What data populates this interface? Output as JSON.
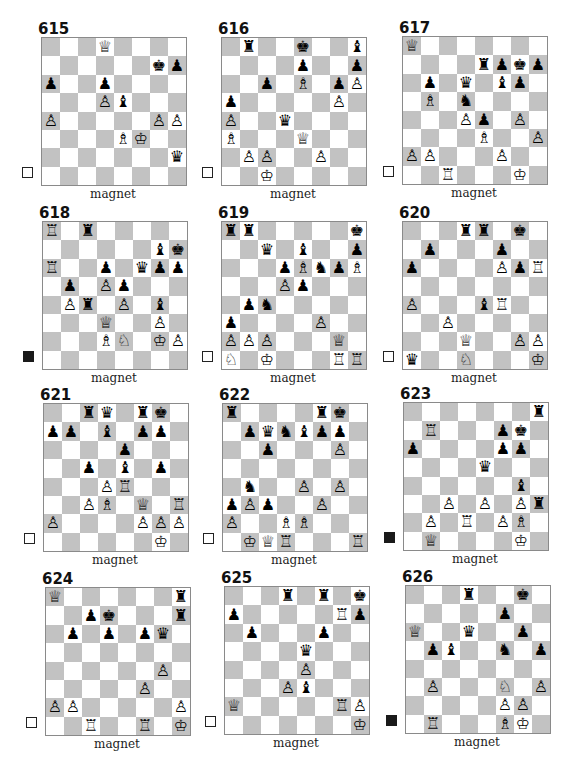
{
  "page": {
    "diagrams": [
      {
        "number": "615",
        "to_move": "white",
        "caption": "magnet",
        "pieces": {
          "d8": "wQ",
          "g7": "bK",
          "h7": "bP",
          "a6": "bP",
          "d6": "bP",
          "d5": "wP",
          "e5": "bB",
          "a4": "wP",
          "g4": "wP",
          "h4": "wP",
          "e3": "wB",
          "f3": "wK",
          "h2": "bQ"
        }
      },
      {
        "number": "616",
        "to_move": "white",
        "caption": "magnet",
        "pieces": {
          "b8": "bR",
          "e8": "bK",
          "h8": "bB",
          "e7": "bP",
          "h7": "bP",
          "c6": "bP",
          "e6": "wB",
          "g6": "bP",
          "h6": "wP",
          "a5": "bP",
          "g5": "wP",
          "a4": "wP",
          "d4": "bQ",
          "a3": "wB",
          "e3": "wQ",
          "b2": "wP",
          "c2": "wP",
          "f2": "wP",
          "c1": "wK"
        }
      },
      {
        "number": "617",
        "to_move": "white",
        "caption": "magnet",
        "pieces": {
          "a8": "wQ",
          "e7": "bR",
          "f7": "bP",
          "g7": "bK",
          "h7": "bP",
          "b6": "bP",
          "d6": "bQ",
          "f6": "bB",
          "g6": "bP",
          "b5": "wB",
          "d5": "bN",
          "d4": "wP",
          "e4": "bP",
          "g4": "wP",
          "e3": "wB",
          "h3": "wP",
          "a2": "wP",
          "b2": "wP",
          "f2": "wP",
          "c1": "wR",
          "g1": "wK"
        }
      },
      {
        "number": "618",
        "to_move": "black",
        "caption": "magnet",
        "pieces": {
          "a8": "wR",
          "c8": "bR",
          "g7": "bB",
          "h7": "bK",
          "a6": "wR",
          "d6": "bP",
          "f6": "bQ",
          "g6": "bP",
          "h6": "bP",
          "b5": "bP",
          "d5": "wP",
          "e5": "bP",
          "b4": "wP",
          "c4": "bR",
          "e4": "wP",
          "g4": "bB",
          "d3": "wQ",
          "g3": "wP",
          "d2": "wB",
          "e2": "wN",
          "g2": "wK",
          "h2": "wP"
        }
      },
      {
        "number": "619",
        "to_move": "white",
        "caption": "magnet",
        "pieces": {
          "a8": "bR",
          "b8": "bR",
          "h8": "bK",
          "c7": "bQ",
          "e7": "bB",
          "h7": "bP",
          "d6": "bP",
          "e6": "wB",
          "f6": "bN",
          "g6": "bP",
          "h6": "wB",
          "d5": "wP",
          "e5": "bP",
          "b4": "bP",
          "c4": "bN",
          "a3": "bP",
          "f3": "wP",
          "a2": "wP",
          "b2": "wP",
          "c2": "wP",
          "g2": "wQ",
          "a1": "wN",
          "c1": "wK",
          "g1": "wR",
          "h1": "wR"
        }
      },
      {
        "number": "620",
        "to_move": "white",
        "caption": "magnet",
        "pieces": {
          "d8": "bR",
          "e8": "bR",
          "g8": "bK",
          "b7": "bP",
          "f7": "bP",
          "a6": "bP",
          "f6": "wP",
          "g6": "bP",
          "h6": "wR",
          "a4": "wP",
          "e4": "bB",
          "f4": "wR",
          "c3": "wP",
          "d2": "wQ",
          "g2": "wP",
          "h2": "wP",
          "a1": "bQ",
          "d1": "wN",
          "h1": "wK"
        }
      },
      {
        "number": "621",
        "to_move": "white",
        "caption": "magnet",
        "pieces": {
          "c8": "bR",
          "d8": "bQ",
          "f8": "bR",
          "g8": "bK",
          "a7": "bP",
          "b7": "bP",
          "d7": "bB",
          "f7": "bP",
          "g7": "bP",
          "e6": "bP",
          "c5": "bP",
          "e5": "bB",
          "g5": "bP",
          "d4": "wP",
          "e4": "wR",
          "c3": "wP",
          "d3": "wB",
          "f3": "wQ",
          "h3": "wR",
          "a2": "wP",
          "f2": "wP",
          "g2": "wP",
          "h2": "wP",
          "g1": "wK"
        }
      },
      {
        "number": "622",
        "to_move": "white",
        "caption": "magnet",
        "pieces": {
          "a8": "bR",
          "f8": "bR",
          "g8": "bK",
          "b7": "bP",
          "c7": "bQ",
          "d7": "bN",
          "e7": "bB",
          "f7": "bP",
          "g7": "bP",
          "c6": "bP",
          "g6": "wP",
          "b4": "bN",
          "e4": "wP",
          "g4": "wP",
          "a3": "bP",
          "b3": "wP",
          "c3": "bP",
          "f3": "wP",
          "a2": "wP",
          "d2": "wB",
          "e2": "wB",
          "b1": "wK",
          "c1": "wQ",
          "d1": "wR",
          "h1": "wR"
        }
      },
      {
        "number": "623",
        "to_move": "black",
        "caption": "magnet",
        "pieces": {
          "h8": "bR",
          "b7": "wR",
          "f7": "bP",
          "g7": "bK",
          "a6": "bP",
          "f6": "bP",
          "g6": "bP",
          "e5": "bQ",
          "g4": "bB",
          "c3": "wP",
          "e3": "wP",
          "g3": "wP",
          "h3": "bR",
          "b2": "wP",
          "d2": "wR",
          "f2": "wP",
          "g2": "wB",
          "b1": "wQ",
          "g1": "wK"
        }
      },
      {
        "number": "624",
        "to_move": "white",
        "caption": "magnet",
        "pieces": {
          "a8": "wQ",
          "h8": "bR",
          "c7": "bP",
          "d7": "bK",
          "h7": "bR",
          "b6": "bP",
          "d6": "bP",
          "f6": "bP",
          "g6": "bQ",
          "g4": "wP",
          "f3": "wP",
          "a2": "wP",
          "b2": "wP",
          "h2": "wP",
          "c1": "wR",
          "f1": "wR",
          "h1": "wK"
        }
      },
      {
        "number": "625",
        "to_move": "white",
        "caption": "magnet",
        "pieces": {
          "d8": "bR",
          "f8": "bR",
          "h8": "bK",
          "a7": "bP",
          "g7": "wR",
          "h7": "bP",
          "b6": "bP",
          "f6": "bP",
          "e5": "bQ",
          "e4": "wP",
          "d3": "wP",
          "e3": "bB",
          "a2": "wQ",
          "g2": "wR",
          "h2": "wP",
          "h1": "wK"
        }
      },
      {
        "number": "626",
        "to_move": "black",
        "caption": "magnet",
        "pieces": {
          "d8": "bR",
          "g8": "bK",
          "f7": "bP",
          "a6": "wQ",
          "d6": "bQ",
          "g6": "bP",
          "b5": "bP",
          "c5": "bB",
          "f5": "bN",
          "h5": "bP",
          "b3": "wP",
          "f3": "wN",
          "h3": "wP",
          "f2": "wP",
          "g2": "wP",
          "b1": "wR",
          "f1": "wB",
          "g1": "wK"
        }
      }
    ]
  },
  "glyphs": {
    "wK": "♔",
    "wQ": "♕",
    "wR": "♖",
    "wB": "♗",
    "wN": "♘",
    "wP": "♙",
    "bK": "♚",
    "bQ": "♛",
    "bR": "♜",
    "bB": "♝",
    "bN": "♞",
    "bP": "♟"
  }
}
